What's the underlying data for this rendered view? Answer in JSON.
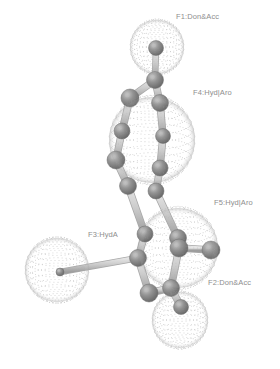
{
  "image": {
    "kind": "pharmacophore-model-3d-render",
    "width": 280,
    "height": 369,
    "background_color": "#ffffff",
    "render_style": "grayscale ball-and-stick molecule with dotted wireframe feature spheres"
  },
  "colors": {
    "background": "#ffffff",
    "atom_fill": "#8a8a8a",
    "atom_shade": "#6e6e6e",
    "atom_highlight": "#bcbcbc",
    "bond_fill": "#cfcfcf",
    "bond_shade": "#a8a8a8",
    "sphere_dots": "#a9a9a9",
    "label_text": "#8e8e8e"
  },
  "features": [
    {
      "id": "F1",
      "label": "F1:Don&Acc",
      "type": "Donor & Acceptor",
      "cx": 157,
      "cy": 47,
      "r": 27,
      "label_x": 176,
      "label_y": 13
    },
    {
      "id": "F4",
      "label": "F4:Hyd|Aro",
      "type": "Hydrophobic | Aromatic",
      "cx": 152,
      "cy": 140,
      "r": 43,
      "label_x": 193,
      "label_y": 89
    },
    {
      "id": "F5",
      "label": "F5:Hyd|Aro",
      "type": "Hydrophobic | Aromatic",
      "cx": 178,
      "cy": 248,
      "r": 40,
      "label_x": 214,
      "label_y": 199
    },
    {
      "id": "F3",
      "label": "F3:HydA",
      "type": "Hydrophobic Aliphatic",
      "cx": 57,
      "cy": 270,
      "r": 32,
      "label_x": 88,
      "label_y": 231
    },
    {
      "id": "F2",
      "label": "F2:Don&Acc",
      "type": "Donor & Acceptor",
      "cx": 180,
      "cy": 320,
      "r": 28,
      "label_x": 208,
      "label_y": 279
    }
  ],
  "molecule": {
    "atoms": [
      {
        "id": "a1",
        "x": 156,
        "y": 48,
        "r": 7.5
      },
      {
        "id": "a2",
        "x": 155,
        "y": 80,
        "r": 8.5
      },
      {
        "id": "a3",
        "x": 130,
        "y": 98,
        "r": 9.0
      },
      {
        "id": "a4",
        "x": 160,
        "y": 103,
        "r": 8.5
      },
      {
        "id": "a5",
        "x": 122,
        "y": 131,
        "r": 8.0
      },
      {
        "id": "a6",
        "x": 163,
        "y": 136,
        "r": 7.5
      },
      {
        "id": "a7",
        "x": 116,
        "y": 160,
        "r": 9.0
      },
      {
        "id": "a8",
        "x": 160,
        "y": 168,
        "r": 8.0
      },
      {
        "id": "a9",
        "x": 128,
        "y": 186,
        "r": 8.5
      },
      {
        "id": "a10",
        "x": 156,
        "y": 191,
        "r": 8.0
      },
      {
        "id": "a11",
        "x": 145,
        "y": 234,
        "r": 8.0
      },
      {
        "id": "a12",
        "x": 178,
        "y": 238,
        "r": 8.5
      },
      {
        "id": "a13",
        "x": 179,
        "y": 248,
        "r": 9.0
      },
      {
        "id": "a14",
        "x": 138,
        "y": 258,
        "r": 8.5
      },
      {
        "id": "a15",
        "x": 211,
        "y": 250,
        "r": 9.0
      },
      {
        "id": "a16",
        "x": 149,
        "y": 293,
        "r": 9.0
      },
      {
        "id": "a17",
        "x": 171,
        "y": 288,
        "r": 8.5
      },
      {
        "id": "a18",
        "x": 181,
        "y": 307,
        "r": 7.5
      },
      {
        "id": "a19",
        "x": 60,
        "y": 272,
        "r": 4.0
      }
    ],
    "bonds": [
      {
        "from": "a1",
        "to": "a2",
        "w": 5
      },
      {
        "from": "a2",
        "to": "a3",
        "w": 6
      },
      {
        "from": "a2",
        "to": "a4",
        "w": 6
      },
      {
        "from": "a3",
        "to": "a5",
        "w": 6
      },
      {
        "from": "a4",
        "to": "a6",
        "w": 6
      },
      {
        "from": "a5",
        "to": "a7",
        "w": 6
      },
      {
        "from": "a6",
        "to": "a8",
        "w": 6
      },
      {
        "from": "a7",
        "to": "a9",
        "w": 6
      },
      {
        "from": "a8",
        "to": "a10",
        "w": 6
      },
      {
        "from": "a9",
        "to": "a11",
        "w": 6
      },
      {
        "from": "a10",
        "to": "a12",
        "w": 6
      },
      {
        "from": "a11",
        "to": "a14",
        "w": 6
      },
      {
        "from": "a12",
        "to": "a13",
        "w": 6
      },
      {
        "from": "a13",
        "to": "a15",
        "w": 6
      },
      {
        "from": "a13",
        "to": "a17",
        "w": 6
      },
      {
        "from": "a14",
        "to": "a16",
        "w": 6
      },
      {
        "from": "a16",
        "to": "a17",
        "w": 6
      },
      {
        "from": "a17",
        "to": "a18",
        "w": 6
      },
      {
        "from": "a14",
        "to": "a19",
        "w": 5
      }
    ]
  }
}
